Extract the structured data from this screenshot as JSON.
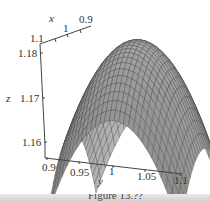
{
  "chart_data": {
    "type": "surface3d",
    "title": "",
    "caption": "Figure 13.??",
    "x_axis": {
      "label": "x",
      "ticks": [
        "1.1",
        "1",
        "0.9"
      ],
      "range": [
        0.9,
        1.1
      ]
    },
    "y_axis": {
      "label": "y",
      "ticks": [
        "0.9",
        "0.95",
        "1",
        "1.05",
        "1.1"
      ],
      "range": [
        0.9,
        1.1
      ]
    },
    "z_axis": {
      "label": "z",
      "ticks": [
        "1.16",
        "1.17",
        "1.18"
      ],
      "range": [
        1.155,
        1.185
      ]
    },
    "surface": {
      "shape": "dome (concave down) with peak near x=1, y=1",
      "approx_peak_z": 1.185,
      "approx_corner_z": 1.157,
      "mesh": "gray wireframe grid"
    },
    "grid": false,
    "legend": null
  },
  "labels": {
    "x": "x",
    "y": "y",
    "z": "z",
    "x_ticks": [
      "1.1",
      "1",
      "0.9"
    ],
    "y_ticks": [
      "0.9",
      "0.95",
      "1",
      "1.05",
      "1.1"
    ],
    "z_ticks": [
      "1.16",
      "1.17",
      "1.18"
    ],
    "caption": "Figure 13.??"
  },
  "colors": {
    "surface_fill": "#9a9a9a",
    "mesh_line": "#444444",
    "axis": "#444444"
  }
}
